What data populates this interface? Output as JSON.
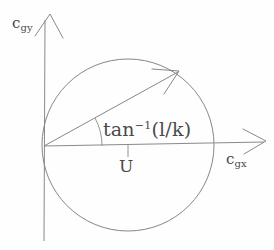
{
  "figure": {
    "background_color": "#fefefe",
    "stroke_color": "#6b6b6b",
    "text_color": "#4a4a4a"
  },
  "axes": {
    "y_axis": {
      "name": "c_gy",
      "label_base": "c",
      "label_sub": "gy",
      "arrow": "up"
    },
    "x_axis": {
      "name": "c_gx",
      "label_base": "c",
      "label_sub": "gx",
      "arrow": "right"
    },
    "origin_label": ""
  },
  "annotations": {
    "angle": {
      "base": "tan",
      "superscript": "−1",
      "argument": "(l/k)",
      "full_text": "tan−1(l/k)"
    },
    "diameter_marker": {
      "label": "U"
    }
  },
  "geometry": {
    "origin": {
      "x": 44,
      "y": 146
    },
    "circle": {
      "cx": 128,
      "cy": 145,
      "r": 86
    },
    "vector": {
      "from_x": 44,
      "from_y": 146,
      "to_x": 178,
      "to_y": 72
    },
    "angle_arc_radius": 58
  }
}
